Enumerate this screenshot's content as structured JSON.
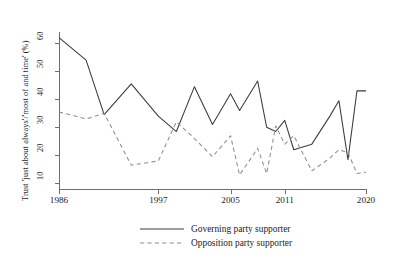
{
  "chart_data": {
    "type": "line",
    "title": "",
    "xlabel": "",
    "ylabel": "Trust 'just about always'/'most of and time' (%)",
    "xlim": [
      1986,
      2020
    ],
    "ylim": [
      8,
      64
    ],
    "grid": false,
    "legend_position": "bottom",
    "xticks": [
      "1986",
      "1997",
      "2005",
      "2011",
      "2020"
    ],
    "xtick_values": [
      1986,
      1997,
      2005,
      2011,
      2020
    ],
    "yticks": [
      "10",
      "20",
      "30",
      "40",
      "50",
      "60"
    ],
    "ytick_values": [
      10,
      20,
      30,
      40,
      50,
      60
    ],
    "x": [
      1986,
      1989,
      1991,
      1994,
      1997,
      1999,
      2001,
      2003,
      2005,
      2006,
      2008,
      2009,
      2010,
      2011,
      2012,
      2014,
      2016,
      2017,
      2018,
      2019,
      2020
    ],
    "series": [
      {
        "name": "Governing party supporter",
        "style": "solid",
        "color": "#3a3a3a",
        "values": [
          62,
          54,
          34.5,
          45.5,
          34,
          28.5,
          44.5,
          31,
          42,
          36,
          46.5,
          30,
          28.5,
          32.5,
          22,
          24,
          34,
          39.5,
          18.5,
          43,
          43
        ]
      },
      {
        "name": "Opposition party supporter",
        "style": "dashed",
        "color": "#8d8d8d",
        "values": [
          35.5,
          33,
          35,
          16.5,
          18,
          32,
          26,
          19.5,
          27,
          13,
          22.5,
          13.5,
          30.5,
          24,
          27,
          14.5,
          19,
          22,
          21,
          13.5,
          14
        ]
      }
    ]
  },
  "legend": {
    "items": [
      {
        "label": "Governing party supporter",
        "style": "solid"
      },
      {
        "label": "Opposition party supporter",
        "style": "dashed"
      }
    ]
  }
}
